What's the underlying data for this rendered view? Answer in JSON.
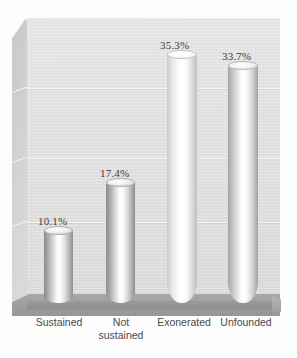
{
  "chart_data": {
    "type": "bar",
    "title": "",
    "subtitle": "",
    "xlabel": "",
    "ylabel": "",
    "categories": [
      "Sustained",
      "Not\nsustained",
      "Exonerated",
      "Unfounded"
    ],
    "values": [
      10.1,
      17.4,
      35.3,
      33.7
    ],
    "value_labels": [
      "10.1%",
      "17.4%",
      "35.3%",
      "33.7%"
    ],
    "unit": "%",
    "ylim": [
      0,
      40
    ],
    "yticks": [
      0,
      10,
      20,
      30
    ],
    "grid": true,
    "gridlines_visible": 3,
    "legend": null,
    "legend_position": "none",
    "style": "3d-cylinder",
    "axis_tick_labels_visible": false,
    "series": [
      {
        "name": "Disposition share",
        "values": [
          10.1,
          17.4,
          35.3,
          33.7
        ]
      }
    ]
  },
  "colors": {
    "background": "#fdfdfd",
    "back_wall": "#e2e2e2",
    "side_wall": "#d2d2d2",
    "floor": "#9d9d9d",
    "gridline": "#f5f5f5",
    "bar_highlight": "#ffffff",
    "bar_shadow": "#8d8d8d",
    "value_label_text": "#3b3b3b",
    "category_label_text": "#4a4a4a"
  },
  "bars": [
    {
      "category": "Sustained",
      "value_label": "10.1%",
      "shade": "shade-dark",
      "left": 44,
      "width": 29,
      "height": 72,
      "label_left": 38,
      "label_top": 215
    },
    {
      "category": "Not sustained",
      "value_label": "17.4%",
      "shade": "shade-dark",
      "left": 106,
      "width": 29,
      "height": 120,
      "label_left": 100,
      "label_top": 167
    },
    {
      "category": "Exonerated",
      "value_label": "35.3%",
      "shade": "shade-light",
      "left": 167,
      "width": 30,
      "height": 248,
      "label_left": 160,
      "label_top": 39
    },
    {
      "category": "Unfounded",
      "value_label": "33.7%",
      "shade": "shade-mid",
      "left": 228,
      "width": 30,
      "height": 237,
      "label_left": 222,
      "label_top": 50
    }
  ],
  "category_labels": [
    {
      "text": "Sustained",
      "left": 21,
      "width": 76
    },
    {
      "text": "Not\nsustained",
      "left": 83,
      "width": 76
    },
    {
      "text": "Exonerated",
      "left": 144,
      "width": 80
    },
    {
      "text": "Unfounded",
      "left": 206,
      "width": 80
    }
  ],
  "gridlines": [
    {
      "top": 70
    },
    {
      "top": 140
    },
    {
      "top": 204
    }
  ],
  "side_wall_gridlines": [
    {
      "top": 74
    },
    {
      "top": 144
    },
    {
      "top": 208
    }
  ]
}
